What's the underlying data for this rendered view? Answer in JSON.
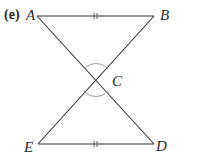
{
  "figure": {
    "part_label": "(e)",
    "points": {
      "A": {
        "label": "A",
        "x": 37,
        "y": 16
      },
      "B": {
        "label": "B",
        "x": 154,
        "y": 16
      },
      "C": {
        "label": "C",
        "x": 96,
        "y": 80
      },
      "D": {
        "label": "D",
        "x": 154,
        "y": 144
      },
      "E": {
        "label": "E",
        "x": 38,
        "y": 144
      }
    },
    "segments": [
      {
        "from": "A",
        "to": "B",
        "tick_marks": 2
      },
      {
        "from": "E",
        "to": "D",
        "tick_marks": 2
      },
      {
        "from": "A",
        "to": "D",
        "tick_marks": 0
      },
      {
        "from": "B",
        "to": "E",
        "tick_marks": 0
      }
    ],
    "angle_marks": [
      {
        "vertex": "C",
        "between": [
          "A",
          "B"
        ],
        "type": "arc"
      },
      {
        "vertex": "C",
        "between": [
          "E",
          "D"
        ],
        "type": "arc"
      }
    ],
    "colors": {
      "line": "#333333",
      "arc": "#9a9a9a",
      "text": "#2a2a2a"
    }
  }
}
